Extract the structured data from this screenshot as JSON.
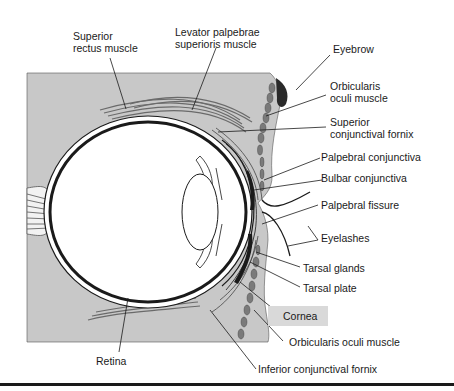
{
  "diagram": {
    "colors": {
      "tissue_gray": "#c8c8c8",
      "muscle_gray": "#7a7a7a",
      "line": "#1a1a1a",
      "background": "#ffffff",
      "highlight_box": "#d9d9d9"
    },
    "labels": {
      "superior_rectus": [
        "Superior",
        "rectus muscle"
      ],
      "levator": [
        "Levator palpebrae",
        "superioris muscle"
      ],
      "eyebrow": "Eyebrow",
      "orbicularis_upper": [
        "Orbicularis",
        "oculi muscle"
      ],
      "superior_fornix": [
        "Superior",
        "conjunctival fornix"
      ],
      "palpebral_conjunctiva": "Palpebral conjunctiva",
      "bulbar_conjunctiva": "Bulbar conjunctiva",
      "palpebral_fissure": "Palpebral fissure",
      "eyelashes": "Eyelashes",
      "tarsal_glands": "Tarsal glands",
      "tarsal_plate": "Tarsal plate",
      "cornea": "Cornea",
      "orbicularis_lower": "Orbicularis oculi muscle",
      "retina": "Retina",
      "inferior_fornix": "Inferior conjunctival fornix"
    }
  }
}
